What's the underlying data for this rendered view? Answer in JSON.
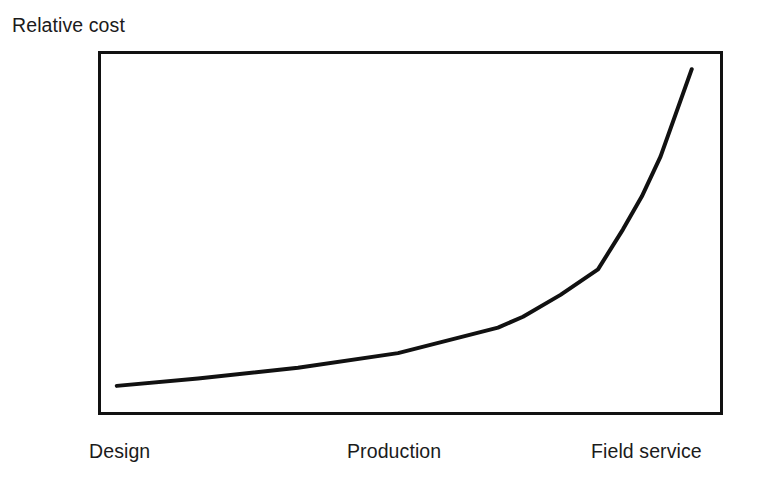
{
  "chart_data": {
    "type": "line",
    "title": "",
    "subtitle": "",
    "ylabel": "Relative cost",
    "xlabel": "",
    "grid": false,
    "legend": false,
    "legend_position": "none",
    "axis_ticks": false,
    "axis_tick_values": false,
    "frame": "full-box",
    "categories": [
      "Design",
      "Production",
      "Field service"
    ],
    "xtick_labels": [
      "Design",
      "Production",
      "Field service"
    ],
    "annotations": [],
    "series": [
      {
        "name": "Relative cost of change",
        "color": "#111111",
        "linewidth": 4,
        "points": [
          {
            "x": 0.03,
            "y": 0.08
          },
          {
            "x": 0.16,
            "y": 0.1
          },
          {
            "x": 0.32,
            "y": 0.13
          },
          {
            "x": 0.48,
            "y": 0.17
          },
          {
            "x": 0.64,
            "y": 0.24
          },
          {
            "x": 0.68,
            "y": 0.27
          },
          {
            "x": 0.74,
            "y": 0.33
          },
          {
            "x": 0.8,
            "y": 0.4
          },
          {
            "x": 0.84,
            "y": 0.51
          },
          {
            "x": 0.87,
            "y": 0.6
          },
          {
            "x": 0.9,
            "y": 0.71
          },
          {
            "x": 0.95,
            "y": 0.95
          }
        ]
      }
    ],
    "xlim": [
      0,
      1
    ],
    "ylim": [
      0,
      1
    ]
  },
  "figure": {
    "background_color": "#ffffff",
    "line_color": "#111111",
    "frame_color": "#111111",
    "text_color": "#1b1b1b"
  }
}
